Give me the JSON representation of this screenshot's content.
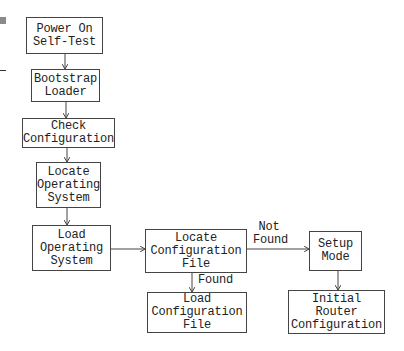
{
  "diagram": {
    "type": "flowchart",
    "title": "",
    "nodes": [
      {
        "id": "post",
        "lines": [
          "Power On",
          "Self-Test"
        ]
      },
      {
        "id": "bootstrap",
        "lines": [
          "Bootstrap",
          "Loader"
        ]
      },
      {
        "id": "check_config",
        "lines": [
          "Check",
          "Configuration"
        ]
      },
      {
        "id": "locate_os",
        "lines": [
          "Locate",
          "Operating",
          "System"
        ]
      },
      {
        "id": "load_os",
        "lines": [
          "Load",
          "Operating",
          "System"
        ]
      },
      {
        "id": "locate_config",
        "lines": [
          "Locate",
          "Configuration",
          "File"
        ]
      },
      {
        "id": "load_config",
        "lines": [
          "Load",
          "Configuration",
          "File"
        ]
      },
      {
        "id": "setup_mode",
        "lines": [
          "Setup",
          "Mode"
        ]
      },
      {
        "id": "initial_router_config",
        "lines": [
          "Initial",
          "Router",
          "Configuration"
        ]
      }
    ],
    "edges": [
      {
        "from": "post",
        "to": "bootstrap",
        "label": ""
      },
      {
        "from": "bootstrap",
        "to": "check_config",
        "label": ""
      },
      {
        "from": "check_config",
        "to": "locate_os",
        "label": ""
      },
      {
        "from": "locate_os",
        "to": "load_os",
        "label": ""
      },
      {
        "from": "load_os",
        "to": "locate_config",
        "label": ""
      },
      {
        "from": "locate_config",
        "to": "load_config",
        "label": "Found"
      },
      {
        "from": "locate_config",
        "to": "setup_mode",
        "label": "Not Found"
      },
      {
        "from": "setup_mode",
        "to": "initial_router_config",
        "label": ""
      }
    ],
    "edge_labels": {
      "found": "Found",
      "not_found_line1": "Not",
      "not_found_line2": "Found"
    },
    "colors": {
      "stroke": "#444444",
      "text": "#222222",
      "background": "#ffffff"
    }
  }
}
